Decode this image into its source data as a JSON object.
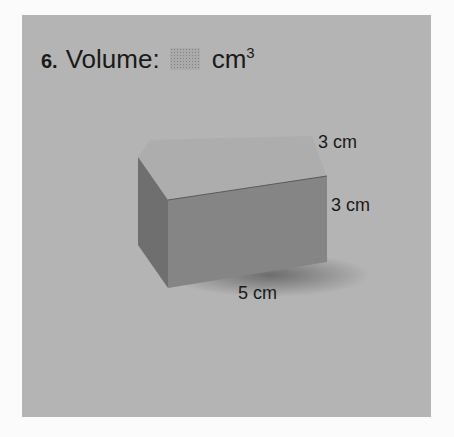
{
  "problem": {
    "number": "6.",
    "prompt": "Volume:",
    "answer_placeholder": "dotted-answer-box",
    "unit": "cm",
    "unit_exponent": "3"
  },
  "figure": {
    "shape": "rectangular prism",
    "dimensions": {
      "depth": "3 cm",
      "height": "3 cm",
      "length": "5 cm"
    }
  },
  "colors": {
    "panel": "#b4b4b4",
    "page": "#fbfbfb",
    "box_front": "#858585",
    "box_side": "#6f6f6f",
    "box_top": "#adadad",
    "text": "#1a1a1a"
  }
}
